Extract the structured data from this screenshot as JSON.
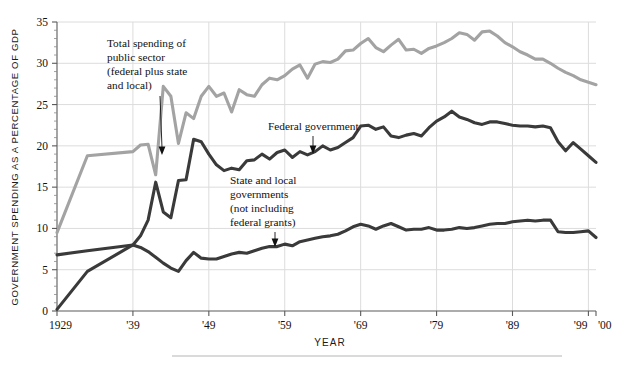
{
  "chart_data": {
    "type": "line",
    "title": "",
    "xlabel": "YEAR",
    "ylabel": "GOVERNMENT SPENDING AS A PERCENTAGE OF GDP",
    "xlim": [
      1929,
      2000
    ],
    "ylim": [
      0,
      35
    ],
    "grid": true,
    "legend_position": "inline-annotations",
    "x_tick_labels": [
      "1929",
      "'39",
      "'49",
      "'59",
      "'69",
      "'79",
      "'89",
      "'99",
      "'00"
    ],
    "x_tick_values": [
      1929,
      1939,
      1949,
      1959,
      1969,
      1979,
      1989,
      1999,
      2000
    ],
    "y_tick_labels": [
      "0",
      "5",
      "10",
      "15",
      "20",
      "25",
      "30",
      "35"
    ],
    "y_tick_values": [
      0,
      5,
      10,
      15,
      20,
      25,
      30,
      35
    ],
    "x": [
      1929,
      1933,
      1939,
      1940,
      1941,
      1942,
      1943,
      1944,
      1945,
      1946,
      1947,
      1948,
      1949,
      1950,
      1951,
      1952,
      1953,
      1954,
      1955,
      1956,
      1957,
      1958,
      1959,
      1960,
      1961,
      1962,
      1963,
      1964,
      1965,
      1966,
      1967,
      1968,
      1969,
      1970,
      1971,
      1972,
      1973,
      1974,
      1975,
      1976,
      1977,
      1978,
      1979,
      1980,
      1981,
      1982,
      1983,
      1984,
      1985,
      1986,
      1987,
      1988,
      1989,
      1990,
      1991,
      1992,
      1993,
      1994,
      1995,
      1996,
      1997,
      1998,
      1999,
      2000
    ],
    "series": [
      {
        "name": "Total spending of public sector (federal plus state and local)",
        "color": "#a3a3a3",
        "values": [
          9.5,
          18.8,
          19.3,
          20.1,
          20.2,
          16.5,
          27.2,
          26.0,
          20.3,
          24.0,
          23.3,
          26.0,
          27.2,
          26.0,
          26.4,
          24.1,
          26.8,
          26.2,
          26.0,
          27.4,
          28.2,
          28.0,
          28.5,
          29.3,
          29.8,
          28.2,
          29.9,
          30.2,
          30.1,
          30.5,
          31.5,
          31.6,
          32.4,
          33.0,
          31.9,
          31.4,
          32.2,
          32.9,
          31.6,
          31.7,
          31.2,
          31.8,
          32.1,
          32.5,
          33.0,
          33.7,
          33.5,
          32.8,
          33.8,
          33.9,
          33.3,
          32.5,
          32.0,
          31.4,
          31.0,
          30.5,
          30.5,
          30.0,
          29.4,
          28.9,
          28.5,
          28.0,
          27.7,
          27.4
        ]
      },
      {
        "name": "Federal government",
        "color": "#3a3a3a",
        "values": [
          0.2,
          4.8,
          8.0,
          9.1,
          11.0,
          15.6,
          12.0,
          11.3,
          15.8,
          15.9,
          20.8,
          20.5,
          19.0,
          17.7,
          17.0,
          17.3,
          17.1,
          18.2,
          18.3,
          19.0,
          18.4,
          19.2,
          19.5,
          18.6,
          19.3,
          18.9,
          19.3,
          20.0,
          19.5,
          19.8,
          20.4,
          21.0,
          22.4,
          22.5,
          22.0,
          22.3,
          21.2,
          21.0,
          21.3,
          21.5,
          21.2,
          22.2,
          23.0,
          23.5,
          24.2,
          23.5,
          23.2,
          22.8,
          22.6,
          22.9,
          22.9,
          22.7,
          22.5,
          22.4,
          22.4,
          22.3,
          22.4,
          22.2,
          20.5,
          19.4,
          20.4,
          19.6,
          18.8,
          18.0
        ]
      },
      {
        "name": "State and local governments (not including federal grants)",
        "color": "#3a3a3a",
        "values": [
          6.8,
          7.3,
          8.0,
          7.7,
          7.2,
          6.5,
          5.8,
          5.2,
          4.8,
          6.1,
          7.1,
          6.4,
          6.3,
          6.3,
          6.6,
          6.9,
          7.1,
          7.0,
          7.3,
          7.6,
          7.8,
          7.8,
          8.1,
          7.9,
          8.4,
          8.6,
          8.8,
          9.0,
          9.1,
          9.3,
          9.7,
          10.2,
          10.5,
          10.3,
          9.9,
          10.3,
          10.6,
          10.2,
          9.8,
          9.9,
          9.9,
          10.1,
          9.8,
          9.8,
          9.9,
          10.1,
          10.0,
          10.1,
          10.3,
          10.5,
          10.6,
          10.6,
          10.8,
          10.9,
          11.0,
          10.9,
          11.0,
          11.0,
          9.6,
          9.5,
          9.5,
          9.6,
          9.7,
          8.9
        ]
      }
    ],
    "annotations": [
      {
        "id": "total-spending",
        "lines": [
          "Total spending of",
          "public sector",
          "(federal plus state",
          "and local)"
        ]
      },
      {
        "id": "federal-government",
        "lines": [
          "Federal government"
        ]
      },
      {
        "id": "state-local",
        "lines": [
          "State and local",
          "governments",
          "(not including",
          "federal grants)"
        ]
      }
    ]
  }
}
